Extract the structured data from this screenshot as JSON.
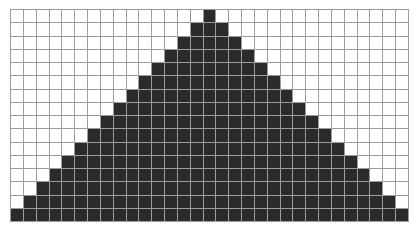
{
  "diagram": {
    "type": "pixel-grid",
    "shape": "stepped-triangle",
    "columns": 31,
    "rows": 16,
    "colors": {
      "filled": "#2b2b2b",
      "empty": "#ffffff",
      "grid_line": "#9c9c9c"
    },
    "filled_per_row": [
      1,
      3,
      5,
      7,
      9,
      11,
      13,
      15,
      17,
      19,
      21,
      23,
      25,
      27,
      29,
      31
    ],
    "apex_column": 15
  }
}
